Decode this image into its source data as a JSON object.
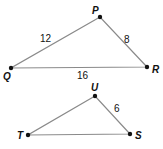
{
  "triangles": [
    {
      "name": "PQR",
      "vertices": {
        "P": {
          "label": "P"
        },
        "Q": {
          "label": "Q"
        },
        "R": {
          "label": "R"
        }
      },
      "sides": {
        "PQ": {
          "label": "12"
        },
        "PR": {
          "label": "8"
        },
        "QR": {
          "label": "16"
        }
      }
    },
    {
      "name": "UTS",
      "vertices": {
        "U": {
          "label": "U"
        },
        "T": {
          "label": "T"
        },
        "S": {
          "label": "S"
        }
      },
      "sides": {
        "US": {
          "label": "6"
        }
      }
    }
  ],
  "colors": {
    "edge": "#8a8a8a",
    "vertex": "#111111"
  }
}
